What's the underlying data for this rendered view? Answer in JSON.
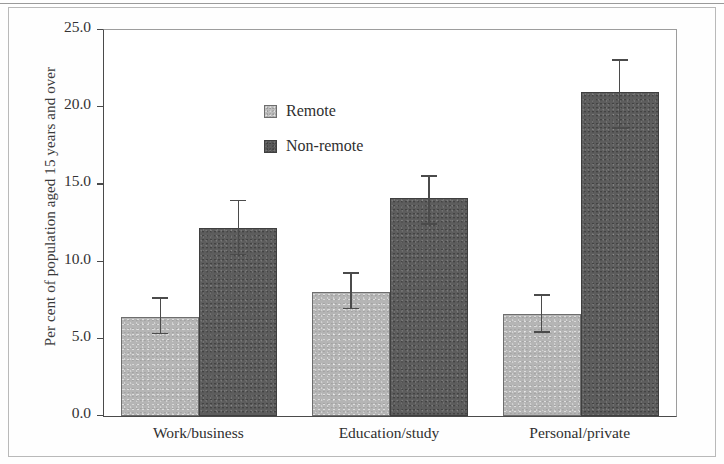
{
  "chart_data": {
    "type": "bar",
    "title": "",
    "subtitle": "",
    "xlabel": "",
    "ylabel": "Per cent of population aged 15 years and over",
    "categories": [
      "Work/business",
      "Education/study",
      "Personal/private"
    ],
    "ylim": [
      0.0,
      25.0
    ],
    "yticks": [
      "0.0",
      "5.0",
      "10.0",
      "15.0",
      "20.0",
      "25.0"
    ],
    "ytick_values": [
      0.0,
      5.0,
      10.0,
      15.0,
      20.0,
      25.0
    ],
    "grid": false,
    "legend_position": "inside-top-left",
    "error_bars": true,
    "series": [
      {
        "name": "Remote",
        "color": "#b5b5b5",
        "values": [
          6.4,
          8.0,
          6.6
        ],
        "err_low": [
          5.3,
          6.9,
          5.4
        ],
        "err_high": [
          7.7,
          9.3,
          7.9
        ]
      },
      {
        "name": "Non-remote",
        "color": "#5d5d5d",
        "values": [
          12.2,
          14.1,
          21.0
        ],
        "err_low": [
          10.4,
          12.4,
          18.6
        ],
        "err_high": [
          14.0,
          15.6,
          23.1
        ]
      }
    ]
  },
  "legend": {
    "items": [
      {
        "label": "Remote",
        "swatch": "remote"
      },
      {
        "label": "Non-remote",
        "swatch": "nonremote"
      }
    ]
  },
  "axes": {
    "y_title": "Per cent of population aged 15 years and over"
  }
}
